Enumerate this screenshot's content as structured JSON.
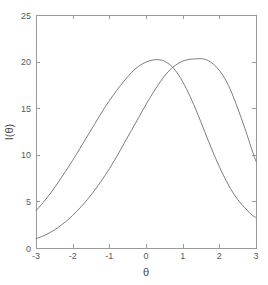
{
  "chart_data": {
    "type": "line",
    "title": "",
    "xlabel": "θ",
    "ylabel": "I(θ)",
    "xlim": [
      -3,
      3
    ],
    "ylim": [
      0,
      25
    ],
    "grid": false,
    "legend": null,
    "background_color": "#ffffff",
    "axis_color": "#9a9a9a",
    "line_color": "#7d7d7d",
    "xticks": [
      -3,
      -2,
      -1,
      0,
      1,
      2,
      3
    ],
    "xtick_labels": [
      "-3",
      "-2",
      "-1",
      "0",
      "1",
      "2",
      "3"
    ],
    "yticks": [
      0,
      5,
      10,
      15,
      20,
      25
    ],
    "ytick_labels": [
      "0",
      "5",
      "10",
      "15",
      "20",
      "25"
    ],
    "series": [
      {
        "name": "curve-1",
        "peak_x": 0.35,
        "peak_y": 20.2,
        "x": [
          -3.0,
          -2.8,
          -2.6,
          -2.4,
          -2.2,
          -2.0,
          -1.8,
          -1.6,
          -1.4,
          -1.2,
          -1.0,
          -0.8,
          -0.6,
          -0.4,
          -0.2,
          0.0,
          0.2,
          0.35,
          0.5,
          0.7,
          0.9,
          1.1,
          1.3,
          1.5,
          1.7,
          1.9,
          2.1,
          2.3,
          2.5,
          2.7,
          2.9,
          3.0
        ],
        "y": [
          4.0,
          4.9,
          5.9,
          7.0,
          8.2,
          9.4,
          10.7,
          12.0,
          13.3,
          14.6,
          15.8,
          16.9,
          17.9,
          18.8,
          19.5,
          19.95,
          20.18,
          20.2,
          20.05,
          19.5,
          18.5,
          17.1,
          15.4,
          13.5,
          11.5,
          9.6,
          7.9,
          6.4,
          5.2,
          4.3,
          3.5,
          3.3
        ]
      },
      {
        "name": "curve-2",
        "peak_x": 1.55,
        "peak_y": 20.3,
        "x": [
          -3.0,
          -2.8,
          -2.6,
          -2.4,
          -2.2,
          -2.0,
          -1.8,
          -1.6,
          -1.4,
          -1.2,
          -1.0,
          -0.8,
          -0.6,
          -0.4,
          -0.2,
          0.0,
          0.2,
          0.4,
          0.6,
          0.8,
          1.0,
          1.2,
          1.4,
          1.55,
          1.7,
          1.9,
          2.1,
          2.3,
          2.5,
          2.7,
          2.9,
          3.0
        ],
        "y": [
          1.0,
          1.3,
          1.7,
          2.2,
          2.8,
          3.5,
          4.3,
          5.2,
          6.2,
          7.3,
          8.5,
          9.8,
          11.2,
          12.6,
          14.0,
          15.4,
          16.7,
          17.9,
          18.9,
          19.6,
          20.05,
          20.25,
          20.3,
          20.3,
          20.1,
          19.5,
          18.5,
          17.0,
          15.0,
          12.8,
          10.4,
          9.3
        ]
      }
    ]
  },
  "axis_titles": {
    "x": "θ",
    "y": "I(θ)"
  }
}
